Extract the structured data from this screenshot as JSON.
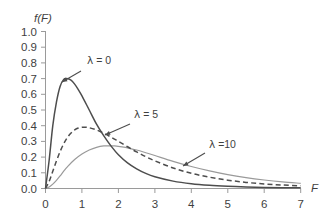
{
  "chart_data": {
    "type": "line",
    "title": "",
    "subtitle": "",
    "xlabel": "F",
    "ylabel": "f(F)",
    "xlim": [
      0,
      7
    ],
    "ylim": [
      0.0,
      1.0
    ],
    "grid": false,
    "legend_position": "inline-annotations",
    "x_ticks": [
      "0",
      "1",
      "2",
      "3",
      "4",
      "5",
      "6",
      "7"
    ],
    "x_tick_values": [
      0,
      1,
      2,
      3,
      4,
      5,
      6,
      7
    ],
    "y_ticks": [
      "0.0",
      "0.1",
      "0.2",
      "0.3",
      "0.4",
      "0.5",
      "0.6",
      "0.7",
      "0.8",
      "0.9",
      "1.0"
    ],
    "y_tick_values": [
      0.0,
      0.1,
      0.2,
      0.3,
      0.4,
      0.5,
      0.6,
      0.7,
      0.8,
      0.9,
      1.0
    ],
    "axis_color": "#9a9a9a",
    "series": [
      {
        "name": "lambda-0",
        "label_lambda": "λ",
        "label_text": " = 0",
        "style": "solid",
        "color": "#4d4d4d",
        "peak_x": 0.58,
        "peak_y": 0.7,
        "x": [
          0.0,
          0.1,
          0.2,
          0.3,
          0.4,
          0.5,
          0.58,
          0.7,
          0.8,
          0.9,
          1.0,
          1.2,
          1.4,
          1.6,
          1.8,
          2.0,
          2.25,
          2.5,
          2.75,
          3.0,
          3.5,
          4.0,
          4.5,
          5.0,
          5.5,
          6.0,
          6.5,
          7.0
        ],
        "y": [
          0.0,
          0.18,
          0.4,
          0.55,
          0.65,
          0.695,
          0.7,
          0.69,
          0.665,
          0.63,
          0.59,
          0.5,
          0.41,
          0.335,
          0.27,
          0.215,
          0.163,
          0.125,
          0.096,
          0.075,
          0.047,
          0.03,
          0.02,
          0.014,
          0.01,
          0.007,
          0.005,
          0.004
        ]
      },
      {
        "name": "lambda-5",
        "label_lambda": "λ",
        "label_text": " = 5",
        "style": "dashed",
        "color": "#4d4d4d",
        "peak_x": 1.1,
        "peak_y": 0.39,
        "x": [
          0.0,
          0.1,
          0.2,
          0.3,
          0.4,
          0.5,
          0.6,
          0.7,
          0.8,
          0.9,
          1.0,
          1.1,
          1.2,
          1.4,
          1.6,
          1.8,
          2.0,
          2.25,
          2.5,
          2.75,
          3.0,
          3.5,
          4.0,
          4.5,
          5.0,
          5.5,
          6.0,
          6.5,
          7.0
        ],
        "y": [
          0.0,
          0.045,
          0.11,
          0.175,
          0.235,
          0.285,
          0.325,
          0.353,
          0.373,
          0.385,
          0.39,
          0.39,
          0.387,
          0.373,
          0.352,
          0.327,
          0.3,
          0.266,
          0.233,
          0.203,
          0.176,
          0.131,
          0.097,
          0.072,
          0.053,
          0.039,
          0.029,
          0.022,
          0.017
        ]
      },
      {
        "name": "lambda-10",
        "label_lambda": "λ",
        "label_text": " =10",
        "style": "solid",
        "color": "#9a9a9a",
        "peak_x": 1.75,
        "peak_y": 0.272,
        "x": [
          0.0,
          0.1,
          0.2,
          0.3,
          0.4,
          0.5,
          0.6,
          0.8,
          1.0,
          1.2,
          1.4,
          1.6,
          1.75,
          1.9,
          2.1,
          2.3,
          2.5,
          2.75,
          3.0,
          3.5,
          4.0,
          4.5,
          5.0,
          5.5,
          6.0,
          6.5,
          7.0
        ],
        "y": [
          0.0,
          0.01,
          0.028,
          0.052,
          0.08,
          0.11,
          0.138,
          0.185,
          0.22,
          0.245,
          0.262,
          0.271,
          0.272,
          0.271,
          0.265,
          0.256,
          0.245,
          0.228,
          0.21,
          0.173,
          0.14,
          0.112,
          0.088,
          0.069,
          0.054,
          0.042,
          0.033
        ]
      }
    ],
    "annotations": [
      {
        "name": "lambda-0-annotation",
        "lambda": "λ",
        "text": " = 0",
        "label_x": 87,
        "label_y": 64,
        "leader_from": [
          81,
          71
        ],
        "leader_to": [
          62,
          82
        ]
      },
      {
        "name": "lambda-5-annotation",
        "lambda": "λ",
        "text": " = 5",
        "label_x": 134,
        "label_y": 118,
        "leader_from": [
          130,
          124
        ],
        "leader_to": [
          105,
          135
        ]
      },
      {
        "name": "lambda-10-annotation",
        "lambda": "λ",
        "text": " =10",
        "label_x": 209,
        "label_y": 148,
        "leader_from": [
          205,
          153
        ],
        "leader_to": [
          183,
          166
        ]
      }
    ]
  }
}
